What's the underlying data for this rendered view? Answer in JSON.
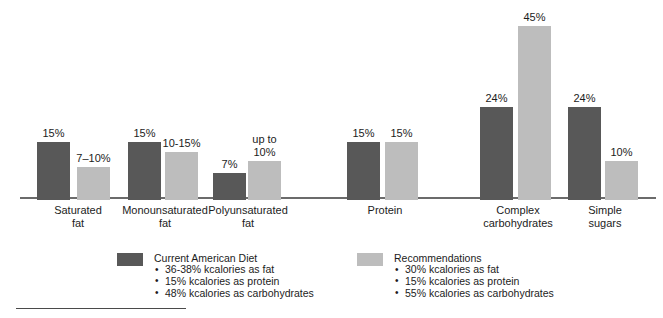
{
  "chart_data": {
    "type": "bar",
    "title": "",
    "xlabel": "",
    "ylabel": "",
    "ylim": [
      0,
      45
    ],
    "grid": false,
    "legend_position": "bottom",
    "units": "% of kcalories",
    "categories": [
      "Saturated\nfat",
      "Monounsaturated\nfat",
      "Polyunsaturated\nfat",
      "Protein",
      "Complex\ncarbohydrates",
      "Simple\nsugars"
    ],
    "series": [
      {
        "name": "Current American Diet",
        "color": "#585858",
        "values": [
          15,
          15,
          7,
          15,
          24,
          24
        ],
        "labels": [
          "15%",
          "15%",
          "7%",
          "15%",
          "24%",
          "24%"
        ]
      },
      {
        "name": "Recommendations",
        "color": "#bdbdbd",
        "values": [
          8.5,
          12.5,
          10,
          15,
          45,
          10
        ],
        "labels": [
          "7–10%",
          "10-15%",
          "up to\n10%",
          "15%",
          "45%",
          "10%"
        ]
      }
    ]
  },
  "legend": {
    "items": [
      {
        "title": "Current American Diet",
        "swatch": "#585858",
        "bullets": [
          "36-38% kcalories as fat",
          "15% kcalories as protein",
          "48% kcalories as carbohydrates"
        ]
      },
      {
        "title": "Recommendations",
        "swatch": "#bdbdbd",
        "bullets": [
          "30% kcalories as fat",
          "15% kcalories as protein",
          "55% kcalories as carbohydrates"
        ]
      }
    ]
  },
  "colors": {
    "current": "#585858",
    "recommended": "#bdbdbd",
    "axis": "#6b6b6b",
    "text": "#1c1c1c",
    "background": "#ffffff"
  },
  "layout": {
    "baseline_y": 197,
    "px_per_percent": 3.87,
    "bar_width": 33,
    "group_positions": [
      {
        "dark_x": 37,
        "light_x": 77,
        "label_cx": 78
      },
      {
        "dark_x": 128,
        "light_x": 165,
        "label_cx": 165
      },
      {
        "dark_x": 213,
        "light_x": 248,
        "label_cx": 248
      },
      {
        "dark_x": 347,
        "light_x": 385,
        "label_cx": 385
      },
      {
        "dark_x": 480,
        "light_x": 518,
        "label_cx": 518
      },
      {
        "dark_x": 568,
        "light_x": 605,
        "label_cx": 605
      }
    ],
    "legend_block_x": [
      117,
      357
    ]
  }
}
